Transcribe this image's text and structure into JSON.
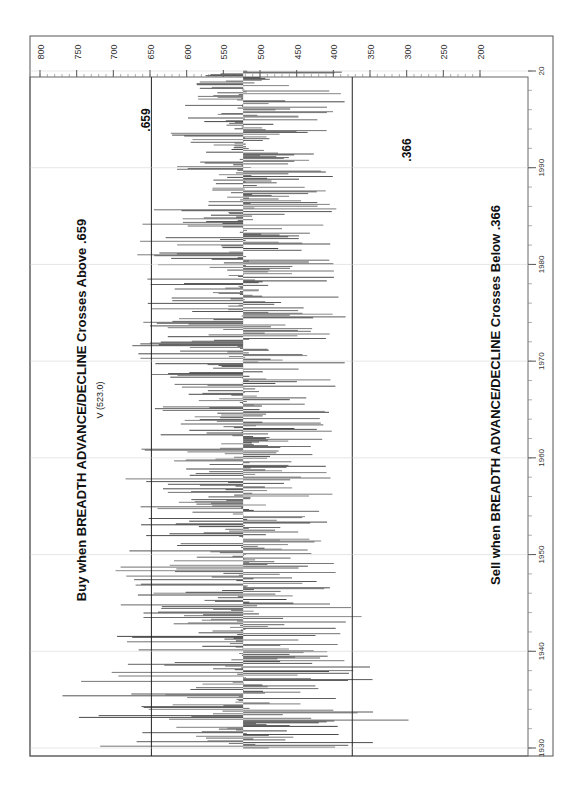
{
  "chart_data": {
    "type": "bar",
    "orientation": "rotated-90-clockwise",
    "title": "V (523.0)",
    "series_label": "BREADTH ADVANCE/DECLINE",
    "annotations": {
      "buy": "Buy when BREADTH ADVANCE/DECLINE Crosses Above .659",
      "sell": "Sell when BREADTH ADVANCE/DECLINE Crosses Below .366",
      "upper_level_label": ".659",
      "lower_level_label": ".366"
    },
    "reference_lines": [
      {
        "name": "buy-threshold",
        "value": 659,
        "label": ".659"
      },
      {
        "name": "sell-threshold",
        "value": 366,
        "label": ".366"
      }
    ],
    "value_axis": {
      "ticks": [
        800,
        750,
        700,
        650,
        600,
        550,
        500,
        450,
        400,
        350,
        300,
        250,
        200
      ],
      "range": [
        200,
        800
      ],
      "direction": "reversed"
    },
    "time_axis": {
      "ticks": [
        "1930",
        "1940",
        "1950",
        "1960",
        "1970",
        "1980",
        "1990",
        "20"
      ],
      "range": [
        1929,
        2000
      ]
    },
    "baseline_value": 523.0,
    "envelope_by_decade": [
      {
        "year": 1930,
        "min": 290,
        "max": 760
      },
      {
        "year": 1935,
        "min": 300,
        "max": 780
      },
      {
        "year": 1940,
        "min": 330,
        "max": 730
      },
      {
        "year": 1945,
        "min": 360,
        "max": 700
      },
      {
        "year": 1950,
        "min": 380,
        "max": 700
      },
      {
        "year": 1955,
        "min": 390,
        "max": 690
      },
      {
        "year": 1960,
        "min": 400,
        "max": 680
      },
      {
        "year": 1965,
        "min": 390,
        "max": 650
      },
      {
        "year": 1970,
        "min": 380,
        "max": 680
      },
      {
        "year": 1975,
        "min": 380,
        "max": 670
      },
      {
        "year": 1980,
        "min": 390,
        "max": 680
      },
      {
        "year": 1985,
        "min": 390,
        "max": 660
      },
      {
        "year": 1990,
        "min": 400,
        "max": 640
      },
      {
        "year": 1995,
        "min": 410,
        "max": 620
      },
      {
        "year": 2000,
        "min": 330,
        "max": 580
      }
    ],
    "grid": false,
    "legend": null
  }
}
